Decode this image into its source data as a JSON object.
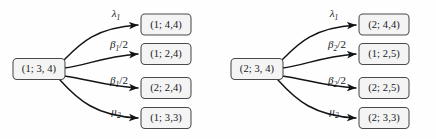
{
  "figure": {
    "type": "state-transition-diagram-pair",
    "background_color": "#fefefe",
    "node_fill": "#f4f4f4",
    "node_stroke": "#4a4a4a",
    "edge_color": "#111315"
  },
  "graphs": [
    {
      "id": "left-graph",
      "source": {
        "label": "(1; 3, 4)"
      },
      "transitions": [
        {
          "rate_symbol": "λ",
          "rate_sub": "1",
          "rate_suffix": "",
          "rate_text": "λ₁",
          "target": "(1; 4,4)"
        },
        {
          "rate_symbol": "β",
          "rate_sub": "1",
          "rate_suffix": "/2",
          "rate_text": "β₁/2",
          "target": "(1; 2,4)"
        },
        {
          "rate_symbol": "β",
          "rate_sub": "1",
          "rate_suffix": "/2",
          "rate_text": "β₁/2",
          "target": "(2; 2,4)"
        },
        {
          "rate_symbol": "μ",
          "rate_sub": "2",
          "rate_suffix": "",
          "rate_text": "μ₂",
          "target": "(1; 3,3)"
        }
      ]
    },
    {
      "id": "right-graph",
      "source": {
        "label": "(2; 3, 4)"
      },
      "transitions": [
        {
          "rate_symbol": "λ",
          "rate_sub": "1",
          "rate_suffix": "",
          "rate_text": "λ₁",
          "target": "(2; 4,4)"
        },
        {
          "rate_symbol": "β",
          "rate_sub": "2",
          "rate_suffix": "/2",
          "rate_text": "β₂/2",
          "target": "(1; 2,5)"
        },
        {
          "rate_symbol": "β",
          "rate_sub": "2",
          "rate_suffix": "/2",
          "rate_text": "β₂/2",
          "target": "(2; 2,5)"
        },
        {
          "rate_symbol": "μ",
          "rate_sub": "2",
          "rate_suffix": "",
          "rate_text": "μ₂",
          "target": "(2; 3,3)"
        }
      ]
    }
  ]
}
